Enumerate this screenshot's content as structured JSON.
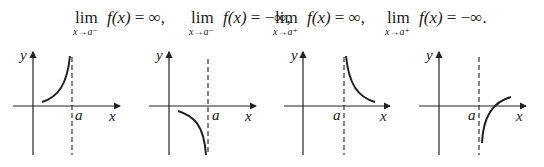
{
  "formulas": [
    {
      "operator": "lim",
      "subscript": "x→a⁻",
      "function": "f(x)",
      "relation": "=",
      "value": "∞",
      "separator": ","
    },
    {
      "operator": "lim",
      "subscript": "x→a⁻",
      "function": "f(x)",
      "relation": "=",
      "value": "−∞",
      "separator": ","
    },
    {
      "operator": "lim",
      "subscript": "x→a⁺",
      "function": "f(x)",
      "relation": "=",
      "value": "∞",
      "separator": ","
    },
    {
      "operator": "lim",
      "subscript": "x→a⁺",
      "function": "f(x)",
      "relation": "=",
      "value": "−∞",
      "separator": "."
    }
  ],
  "graphs": [
    {
      "id": "left-limit-positive-infinity",
      "x_axis_label": "x",
      "y_axis_label": "y",
      "asymptote_label": "a",
      "description": "curve rises to +∞ as x approaches a from the left"
    },
    {
      "id": "left-limit-negative-infinity",
      "x_axis_label": "x",
      "y_axis_label": "y",
      "asymptote_label": "a",
      "description": "curve falls to −∞ as x approaches a from the left"
    },
    {
      "id": "right-limit-positive-infinity",
      "x_axis_label": "x",
      "y_axis_label": "y",
      "asymptote_label": "a",
      "description": "curve rises to +∞ as x approaches a from the right"
    },
    {
      "id": "right-limit-negative-infinity",
      "x_axis_label": "x",
      "y_axis_label": "y",
      "asymptote_label": "a",
      "description": "curve falls to −∞ as x approaches a from the right"
    }
  ],
  "colors": {
    "ink": "#222222",
    "background": "#ffffff"
  }
}
